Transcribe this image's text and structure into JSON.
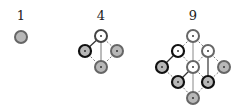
{
  "diagrams": [
    {
      "label": "1",
      "cx": 21
    },
    {
      "label": "4",
      "cx": 101
    },
    {
      "label": "9",
      "cx": 193
    }
  ],
  "colors": {
    "node_gray": "#b8b8b8",
    "node_white": "#ffffff",
    "stroke_dark": "#111111",
    "stroke_gray": "#777777",
    "edge": "#555555"
  }
}
